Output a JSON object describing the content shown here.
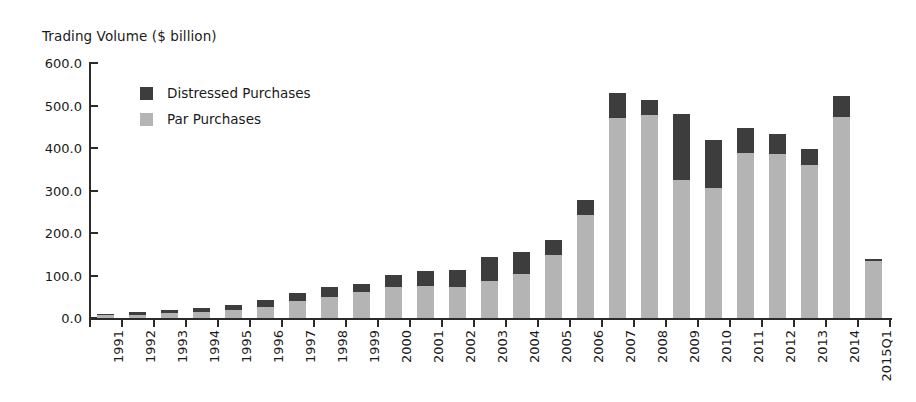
{
  "chart_data": {
    "type": "bar",
    "subtype": "stacked",
    "title": "",
    "ylabel": "Trading Volume ($ billion)",
    "xlabel": "",
    "ylim": [
      0,
      600
    ],
    "ytick_labels": [
      "600.0",
      "500.0",
      "400.0",
      "300.0",
      "200.0",
      "100.0",
      "0.0"
    ],
    "ytick_values": [
      600,
      500,
      400,
      300,
      200,
      100,
      0
    ],
    "grid": false,
    "legend_position": "upper-left-inside",
    "categories": [
      "1991",
      "1992",
      "1993",
      "1994",
      "1995",
      "1996",
      "1997",
      "1998",
      "1999",
      "2000",
      "2001",
      "2002",
      "2003",
      "2004",
      "2005",
      "2006",
      "2007",
      "2008",
      "2009",
      "2010",
      "2011",
      "2012",
      "2013",
      "2014",
      "2015Q1"
    ],
    "series": [
      {
        "name": "Par Purchases",
        "color": "#b4b4b4",
        "values": [
          6,
          8,
          11,
          14,
          20,
          25,
          40,
          50,
          62,
          72,
          75,
          72,
          87,
          103,
          148,
          242,
          470,
          478,
          325,
          306,
          388,
          386,
          360,
          473,
          135
        ]
      },
      {
        "name": "Distressed Purchases",
        "color": "#3d3d3d",
        "values": [
          4,
          6,
          8,
          9,
          11,
          17,
          20,
          22,
          18,
          30,
          35,
          42,
          56,
          52,
          36,
          36,
          60,
          35,
          155,
          113,
          59,
          47,
          38,
          49,
          3
        ]
      }
    ],
    "totals": [
      10,
      14,
      19,
      23,
      31,
      42,
      60,
      72,
      80,
      102,
      110,
      114,
      143,
      155,
      184,
      278,
      530,
      513,
      480,
      419,
      447,
      433,
      398,
      522,
      138
    ]
  },
  "legend": {
    "items": [
      {
        "label": "Distressed Purchases",
        "swatch": "distressed-swatch",
        "color": "#3d3d3d"
      },
      {
        "label": "Par Purchases",
        "swatch": "par-swatch",
        "color": "#b4b4b4"
      }
    ]
  },
  "axis": {
    "y_title": "Trading Volume ($ billion)"
  }
}
